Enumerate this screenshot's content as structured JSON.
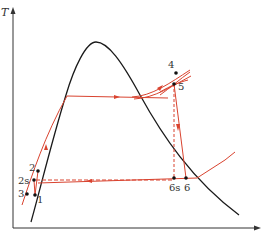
{
  "diagram": {
    "type": "T-s diagram, Rankine cycle with superheat and reheat-free expansion",
    "axes": {
      "y_label": "T",
      "x_label": ""
    },
    "colors": {
      "saturation_dome": "#1a1a1a",
      "cycle": "#d9432f",
      "axes": "#333333",
      "points": "#111111"
    },
    "points": [
      {
        "id": "1",
        "label": "1"
      },
      {
        "id": "2",
        "label": "2"
      },
      {
        "id": "2s",
        "label": "2s"
      },
      {
        "id": "3",
        "label": "3"
      },
      {
        "id": "4",
        "label": "4"
      },
      {
        "id": "5",
        "label": "5"
      },
      {
        "id": "6s",
        "label": "6s"
      },
      {
        "id": "6",
        "label": "6"
      }
    ]
  }
}
